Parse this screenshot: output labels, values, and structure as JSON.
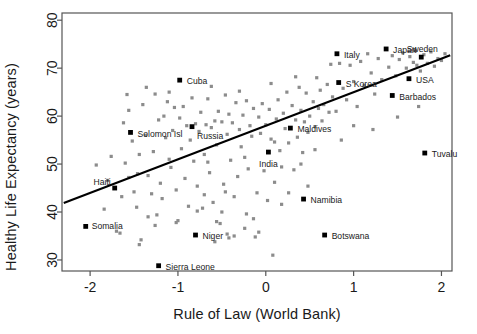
{
  "chart_data": {
    "type": "scatter",
    "title": "",
    "xlabel": "Rule of Law (World Bank)",
    "ylabel": "Healthy Life Expectancy (years)",
    "xlim": [
      -2.32,
      2.12
    ],
    "ylim": [
      27.7,
      81.5
    ],
    "xticks": [
      -2,
      -1,
      0,
      1,
      2
    ],
    "xticklabels": [
      "-2",
      "-1",
      "0",
      "1",
      "2"
    ],
    "yticks": [
      30,
      40,
      50,
      60,
      70,
      80
    ],
    "yticklabels": [
      "30",
      "40",
      "50",
      "60",
      "70",
      "80"
    ],
    "grid": false,
    "legend": false,
    "point_color": "#8c8c8c",
    "highlight_color": "#000000",
    "line_color": "#000000",
    "frame_color": "#555555",
    "trendline": {
      "type": "linear",
      "x_start": -2.3,
      "y_start": 41.9,
      "x_end": 2.1,
      "y_end": 72.7
    },
    "labeled_points": [
      {
        "name": "Cuba",
        "x": -0.98,
        "y": 67.5,
        "label_dx": 7,
        "label_dy": 1,
        "anchor": "start"
      },
      {
        "name": "Italy",
        "x": 0.81,
        "y": 73.0,
        "label_dx": 7,
        "label_dy": 1,
        "anchor": "start"
      },
      {
        "name": "Japan",
        "x": 1.37,
        "y": 74.0,
        "label_dx": 7,
        "label_dy": 1,
        "anchor": "start"
      },
      {
        "name": "Sweden",
        "x": 1.77,
        "y": 72.3,
        "label_dx": 1,
        "label_dy": -8,
        "anchor": "middle"
      },
      {
        "name": "USA",
        "x": 1.63,
        "y": 67.8,
        "label_dx": 7,
        "label_dy": 1,
        "anchor": "start"
      },
      {
        "name": "S Korea",
        "x": 0.83,
        "y": 67.0,
        "label_dx": 7,
        "label_dy": 1,
        "anchor": "start"
      },
      {
        "name": "Barbados",
        "x": 1.44,
        "y": 64.3,
        "label_dx": 7,
        "label_dy": 1,
        "anchor": "start"
      },
      {
        "name": "Russia",
        "x": -0.84,
        "y": 57.8,
        "label_dx": 5,
        "label_dy": 9,
        "anchor": "start"
      },
      {
        "name": "Solomon Isl",
        "x": -1.54,
        "y": 56.6,
        "label_dx": 7,
        "label_dy": 1,
        "anchor": "start"
      },
      {
        "name": "Maldives",
        "x": 0.28,
        "y": 57.5,
        "label_dx": 7,
        "label_dy": 1,
        "anchor": "start"
      },
      {
        "name": "India",
        "x": 0.03,
        "y": 52.5,
        "label_dx": 0,
        "label_dy": 12,
        "anchor": "middle"
      },
      {
        "name": "Tuvalu",
        "x": 1.81,
        "y": 52.3,
        "label_dx": 7,
        "label_dy": 1,
        "anchor": "start"
      },
      {
        "name": "Haiti",
        "x": -1.72,
        "y": 45.0,
        "label_dx": -4,
        "label_dy": -6,
        "anchor": "end"
      },
      {
        "name": "Namibia",
        "x": 0.43,
        "y": 42.7,
        "label_dx": 7,
        "label_dy": 1,
        "anchor": "start"
      },
      {
        "name": "Somalia",
        "x": -2.05,
        "y": 37.0,
        "label_dx": 6,
        "label_dy": -1,
        "anchor": "start"
      },
      {
        "name": "Niger",
        "x": -0.8,
        "y": 35.2,
        "label_dx": 7,
        "label_dy": 1,
        "anchor": "start"
      },
      {
        "name": "Botswana",
        "x": 0.67,
        "y": 35.2,
        "label_dx": 7,
        "label_dy": 1,
        "anchor": "start"
      },
      {
        "name": "Sierra Leone",
        "x": -1.22,
        "y": 28.8,
        "label_dx": 7,
        "label_dy": 1,
        "anchor": "start"
      }
    ],
    "points": [
      {
        "x": -1.93,
        "y": 49.8
      },
      {
        "x": -1.84,
        "y": 40.6
      },
      {
        "x": -1.8,
        "y": 46.6
      },
      {
        "x": -1.76,
        "y": 51.6
      },
      {
        "x": -1.7,
        "y": 36.0
      },
      {
        "x": -1.66,
        "y": 35.6
      },
      {
        "x": -1.62,
        "y": 58.6
      },
      {
        "x": -1.6,
        "y": 50.2
      },
      {
        "x": -1.58,
        "y": 64.5
      },
      {
        "x": -1.56,
        "y": 61.2
      },
      {
        "x": -1.52,
        "y": 54.8
      },
      {
        "x": -1.5,
        "y": 44.2
      },
      {
        "x": -1.47,
        "y": 41.0
      },
      {
        "x": -1.44,
        "y": 33.2
      },
      {
        "x": -1.42,
        "y": 34.2
      },
      {
        "x": -1.4,
        "y": 62.4
      },
      {
        "x": -1.37,
        "y": 56.0
      },
      {
        "x": -1.34,
        "y": 47.6
      },
      {
        "x": -1.3,
        "y": 43.8
      },
      {
        "x": -1.28,
        "y": 52.6
      },
      {
        "x": -1.26,
        "y": 64.6
      },
      {
        "x": -1.24,
        "y": 39.4
      },
      {
        "x": -1.22,
        "y": 59.2
      },
      {
        "x": -1.2,
        "y": 46.0
      },
      {
        "x": -1.18,
        "y": 42.8
      },
      {
        "x": -1.16,
        "y": 60.0
      },
      {
        "x": -1.14,
        "y": 55.5
      },
      {
        "x": -1.12,
        "y": 63.0
      },
      {
        "x": -1.1,
        "y": 51.0
      },
      {
        "x": -1.08,
        "y": 49.3
      },
      {
        "x": -1.06,
        "y": 57.0
      },
      {
        "x": -1.04,
        "y": 61.8
      },
      {
        "x": -1.02,
        "y": 44.6
      },
      {
        "x": -1.0,
        "y": 38.2
      },
      {
        "x": -0.98,
        "y": 59.6
      },
      {
        "x": -0.96,
        "y": 53.2
      },
      {
        "x": -0.94,
        "y": 62.0
      },
      {
        "x": -0.92,
        "y": 47.0
      },
      {
        "x": -0.9,
        "y": 58.0
      },
      {
        "x": -0.88,
        "y": 41.2
      },
      {
        "x": -0.86,
        "y": 55.0
      },
      {
        "x": -0.84,
        "y": 63.8
      },
      {
        "x": -0.82,
        "y": 50.6
      },
      {
        "x": -0.8,
        "y": 58.4
      },
      {
        "x": -0.78,
        "y": 45.4
      },
      {
        "x": -0.76,
        "y": 56.8
      },
      {
        "x": -0.74,
        "y": 60.8
      },
      {
        "x": -0.72,
        "y": 40.8
      },
      {
        "x": -0.7,
        "y": 52.0
      },
      {
        "x": -0.68,
        "y": 58.2
      },
      {
        "x": -0.66,
        "y": 63.6
      },
      {
        "x": -0.64,
        "y": 48.2
      },
      {
        "x": -0.62,
        "y": 57.6
      },
      {
        "x": -0.6,
        "y": 42.0
      },
      {
        "x": -0.58,
        "y": 59.0
      },
      {
        "x": -0.56,
        "y": 54.0
      },
      {
        "x": -0.54,
        "y": 61.0
      },
      {
        "x": -0.52,
        "y": 37.6
      },
      {
        "x": -0.5,
        "y": 58.8
      },
      {
        "x": -0.48,
        "y": 45.8
      },
      {
        "x": -0.46,
        "y": 64.4
      },
      {
        "x": -0.44,
        "y": 56.2
      },
      {
        "x": -0.42,
        "y": 60.4
      },
      {
        "x": -0.4,
        "y": 50.8
      },
      {
        "x": -0.38,
        "y": 58.6
      },
      {
        "x": -0.36,
        "y": 35.0
      },
      {
        "x": -0.34,
        "y": 62.8
      },
      {
        "x": -0.32,
        "y": 47.4
      },
      {
        "x": -0.3,
        "y": 57.2
      },
      {
        "x": -0.28,
        "y": 53.6
      },
      {
        "x": -0.26,
        "y": 60.2
      },
      {
        "x": -0.24,
        "y": 36.6
      },
      {
        "x": -0.22,
        "y": 63.2
      },
      {
        "x": -0.2,
        "y": 49.0
      },
      {
        "x": -0.18,
        "y": 58.0
      },
      {
        "x": -0.16,
        "y": 55.8
      },
      {
        "x": -0.14,
        "y": 61.6
      },
      {
        "x": -0.12,
        "y": 34.8
      },
      {
        "x": -0.1,
        "y": 44.0
      },
      {
        "x": -0.08,
        "y": 59.8
      },
      {
        "x": -0.06,
        "y": 56.4
      },
      {
        "x": -0.04,
        "y": 62.6
      },
      {
        "x": -0.02,
        "y": 48.6
      },
      {
        "x": 0.0,
        "y": 58.2
      },
      {
        "x": 0.02,
        "y": 42.4
      },
      {
        "x": 0.04,
        "y": 61.4
      },
      {
        "x": 0.06,
        "y": 55.2
      },
      {
        "x": 0.08,
        "y": 31.0
      },
      {
        "x": 0.1,
        "y": 46.2
      },
      {
        "x": 0.12,
        "y": 59.4
      },
      {
        "x": 0.14,
        "y": 63.4
      },
      {
        "x": 0.16,
        "y": 52.8
      },
      {
        "x": 0.18,
        "y": 41.6
      },
      {
        "x": 0.2,
        "y": 60.6
      },
      {
        "x": 0.22,
        "y": 57.4
      },
      {
        "x": 0.24,
        "y": 65.0
      },
      {
        "x": 0.26,
        "y": 54.4
      },
      {
        "x": 0.3,
        "y": 62.2
      },
      {
        "x": 0.32,
        "y": 48.8
      },
      {
        "x": 0.34,
        "y": 59.2
      },
      {
        "x": 0.36,
        "y": 55.6
      },
      {
        "x": 0.38,
        "y": 66.0
      },
      {
        "x": 0.4,
        "y": 61.2
      },
      {
        "x": 0.42,
        "y": 52.4
      },
      {
        "x": 0.44,
        "y": 58.8
      },
      {
        "x": 0.46,
        "y": 64.8
      },
      {
        "x": 0.48,
        "y": 56.6
      },
      {
        "x": 0.5,
        "y": 60.0
      },
      {
        "x": 0.54,
        "y": 63.0
      },
      {
        "x": 0.56,
        "y": 57.8
      },
      {
        "x": 0.58,
        "y": 68.0
      },
      {
        "x": 0.6,
        "y": 61.6
      },
      {
        "x": 0.62,
        "y": 65.4
      },
      {
        "x": 0.64,
        "y": 59.0
      },
      {
        "x": 0.66,
        "y": 62.4
      },
      {
        "x": 0.7,
        "y": 66.6
      },
      {
        "x": 0.72,
        "y": 60.8
      },
      {
        "x": 0.74,
        "y": 70.8
      },
      {
        "x": 0.76,
        "y": 64.0
      },
      {
        "x": 0.8,
        "y": 61.0
      },
      {
        "x": 0.84,
        "y": 71.0
      },
      {
        "x": 0.88,
        "y": 65.8
      },
      {
        "x": 0.92,
        "y": 63.4
      },
      {
        "x": 0.96,
        "y": 70.6
      },
      {
        "x": 1.0,
        "y": 67.2
      },
      {
        "x": 1.04,
        "y": 62.0
      },
      {
        "x": 1.08,
        "y": 71.4
      },
      {
        "x": 1.12,
        "y": 66.4
      },
      {
        "x": 1.16,
        "y": 73.0
      },
      {
        "x": 1.2,
        "y": 69.0
      },
      {
        "x": 1.24,
        "y": 64.6
      },
      {
        "x": 1.28,
        "y": 72.0
      },
      {
        "x": 1.32,
        "y": 67.6
      },
      {
        "x": 1.4,
        "y": 70.2
      },
      {
        "x": 1.44,
        "y": 72.6
      },
      {
        "x": 1.48,
        "y": 68.4
      },
      {
        "x": 1.52,
        "y": 71.8
      },
      {
        "x": 1.56,
        "y": 73.2
      },
      {
        "x": 1.6,
        "y": 70.0
      },
      {
        "x": 1.64,
        "y": 72.4
      },
      {
        "x": 1.68,
        "y": 71.2
      },
      {
        "x": 1.7,
        "y": 73.6
      },
      {
        "x": 1.72,
        "y": 70.6
      },
      {
        "x": 1.76,
        "y": 69.4
      },
      {
        "x": 1.8,
        "y": 72.8
      },
      {
        "x": 1.84,
        "y": 71.0
      },
      {
        "x": 1.88,
        "y": 73.4
      },
      {
        "x": 1.92,
        "y": 70.4
      },
      {
        "x": 1.96,
        "y": 72.0
      },
      {
        "x": 2.0,
        "y": 71.6
      },
      {
        "x": 2.04,
        "y": 73.0
      },
      {
        "x": -1.36,
        "y": 66.0
      },
      {
        "x": -0.62,
        "y": 66.2
      },
      {
        "x": -0.3,
        "y": 65.2
      },
      {
        "x": 0.06,
        "y": 66.8
      },
      {
        "x": 0.34,
        "y": 68.2
      },
      {
        "x": -1.1,
        "y": 65.0
      },
      {
        "x": -1.46,
        "y": 48.0
      },
      {
        "x": -1.64,
        "y": 43.2
      },
      {
        "x": -1.34,
        "y": 39.0
      },
      {
        "x": -1.26,
        "y": 37.2
      },
      {
        "x": -1.02,
        "y": 37.8
      },
      {
        "x": -0.78,
        "y": 40.2
      },
      {
        "x": -0.7,
        "y": 43.6
      },
      {
        "x": -0.58,
        "y": 33.8
      },
      {
        "x": -0.56,
        "y": 38.0
      },
      {
        "x": -0.5,
        "y": 40.0
      },
      {
        "x": -0.46,
        "y": 44.2
      },
      {
        "x": -0.44,
        "y": 35.4
      },
      {
        "x": -0.42,
        "y": 34.6
      },
      {
        "x": -0.36,
        "y": 43.2
      },
      {
        "x": -0.22,
        "y": 39.6
      },
      {
        "x": -0.14,
        "y": 38.6
      },
      {
        "x": -0.08,
        "y": 35.8
      },
      {
        "x": 0.18,
        "y": 49.4
      },
      {
        "x": 0.26,
        "y": 44.0
      },
      {
        "x": 0.4,
        "y": 50.0
      },
      {
        "x": 0.56,
        "y": 53.0
      },
      {
        "x": 0.86,
        "y": 55.0
      },
      {
        "x": 1.0,
        "y": 58.0
      },
      {
        "x": 1.22,
        "y": 57.2
      },
      {
        "x": 1.5,
        "y": 59.8
      },
      {
        "x": 1.74,
        "y": 62.0
      },
      {
        "x": -1.56,
        "y": 47.2
      },
      {
        "x": -1.44,
        "y": 52.0
      },
      {
        "x": -0.66,
        "y": 50.4
      },
      {
        "x": -0.24,
        "y": 51.4
      },
      {
        "x": 0.1,
        "y": 54.6
      },
      {
        "x": 0.48,
        "y": 45.4
      }
    ]
  }
}
